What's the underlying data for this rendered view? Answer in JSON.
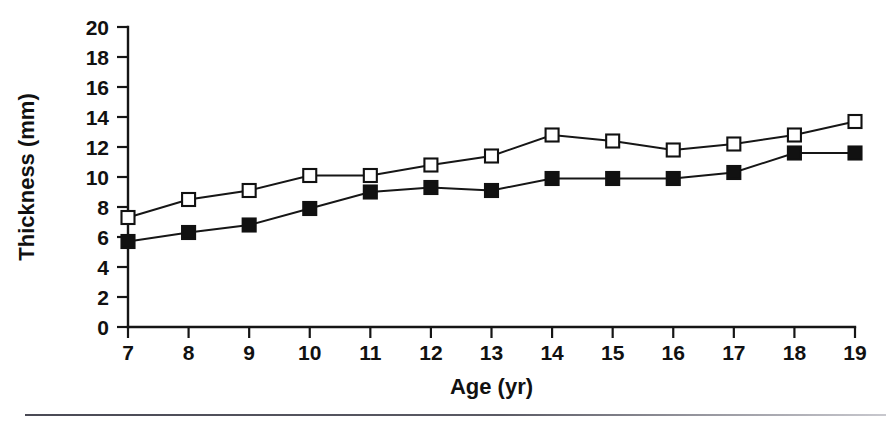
{
  "chart_data": {
    "type": "line",
    "title": "",
    "xlabel": "Age (yr)",
    "ylabel": "Thickness (mm)",
    "x": [
      7,
      8,
      9,
      10,
      11,
      12,
      13,
      14,
      15,
      16,
      17,
      18,
      19
    ],
    "xticklabels": [
      "7",
      "8",
      "9",
      "10",
      "11",
      "12",
      "13",
      "14",
      "15",
      "16",
      "17",
      "18",
      "19"
    ],
    "yticklabels": [
      "0",
      "2",
      "4",
      "6",
      "8",
      "10",
      "12",
      "14",
      "16",
      "18",
      "20"
    ],
    "yticks": [
      0,
      2,
      4,
      6,
      8,
      10,
      12,
      14,
      16,
      18,
      20
    ],
    "xlim": [
      7,
      19
    ],
    "ylim": [
      0,
      20
    ],
    "grid": false,
    "legend": "none",
    "series": [
      {
        "name": "open-square-series",
        "marker": "open-square",
        "color": "#111111",
        "values": [
          7.3,
          8.5,
          9.1,
          10.1,
          10.1,
          10.8,
          11.4,
          12.8,
          12.4,
          11.8,
          12.2,
          12.8,
          13.7
        ]
      },
      {
        "name": "filled-square-series",
        "marker": "filled-square",
        "color": "#111111",
        "values": [
          5.7,
          6.3,
          6.8,
          7.9,
          9.0,
          9.3,
          9.1,
          9.9,
          9.9,
          9.9,
          10.3,
          11.6,
          11.6
        ]
      }
    ]
  }
}
